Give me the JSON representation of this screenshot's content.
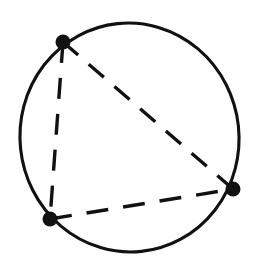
{
  "figure": {
    "background_color": "#ffffff",
    "ink_color": "#111111"
  },
  "canvas": {
    "width": 257,
    "height": 262
  },
  "chart_data": {
    "type": "scatter",
    "xlabel": "",
    "ylabel": "",
    "xlim": [
      0,
      257
    ],
    "ylim": [
      0,
      262
    ],
    "grid": false,
    "legend": false,
    "shapes": [
      {
        "name": "circumscribed-circle",
        "kind": "ellipse",
        "cx": 129.5,
        "cy": 137.5,
        "rx": 109.5,
        "ry": 114.5,
        "rotation": -6,
        "stroke": "#111111",
        "stroke_width": 3.1,
        "fill": "none",
        "dashed": false
      }
    ],
    "points": [
      {
        "name": "vertex-top-left",
        "label": "A",
        "x": 63,
        "y": 42,
        "radius": 7.5,
        "color": "#111111"
      },
      {
        "name": "vertex-bottom-left",
        "label": "B",
        "x": 50,
        "y": 219,
        "radius": 7.5,
        "color": "#111111"
      },
      {
        "name": "vertex-right",
        "label": "C",
        "x": 233,
        "y": 189,
        "radius": 7.5,
        "color": "#111111"
      }
    ],
    "edges": [
      {
        "name": "chord-left",
        "from": "vertex-top-left",
        "to": "vertex-bottom-left",
        "x1": 63,
        "y1": 42,
        "x2": 50,
        "y2": 219,
        "dashed": true,
        "dash_pattern": "21 15",
        "stroke": "#111111",
        "stroke_width": 3.4
      },
      {
        "name": "chord-diagonal",
        "from": "vertex-top-left",
        "to": "vertex-right",
        "x1": 63,
        "y1": 42,
        "x2": 233,
        "y2": 189,
        "dashed": true,
        "dash_pattern": "20 14",
        "stroke": "#111111",
        "stroke_width": 3.4
      },
      {
        "name": "chord-bottom",
        "from": "vertex-bottom-left",
        "to": "vertex-right",
        "x1": 50,
        "y1": 219,
        "x2": 233,
        "y2": 189,
        "dashed": true,
        "dash_pattern": "22 15",
        "stroke": "#111111",
        "stroke_width": 3.4
      }
    ]
  }
}
